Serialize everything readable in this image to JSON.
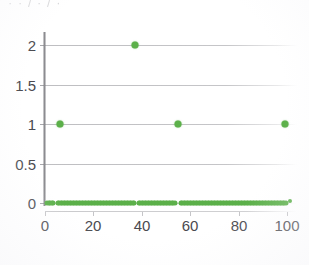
{
  "figure": {
    "title_remnant": "· · / · / ·",
    "background_color": "#ffffff",
    "marker_color": "#5cb04a",
    "gridline_color": "#96969b",
    "axis_color": "#78787d",
    "tick_label_color": "#4a4a4f"
  },
  "axes": {
    "y_ticks": [
      "0",
      "0.5",
      "1",
      "1.5",
      "2"
    ],
    "x_ticks": [
      "0",
      "20",
      "40",
      "60",
      "80",
      "100"
    ]
  },
  "chart_data": {
    "type": "scatter",
    "title": "",
    "xlabel": "",
    "ylabel": "",
    "xlim": [
      0,
      103
    ],
    "ylim": [
      0,
      2.18
    ],
    "grid": true,
    "legend": "none",
    "y_ticks": [
      0,
      0.5,
      1,
      1.5,
      2
    ],
    "x_ticks": [
      0,
      20,
      40,
      60,
      80,
      100
    ],
    "marker_color": "#5cb04a",
    "series": [
      {
        "name": "values",
        "description": "Dense run of points at y=0 across the full x range with three gaps, three isolated points at y=1, one isolated point at y=2, and a trailing point at y=100.",
        "points_y2": [
          [
            37,
            2
          ]
        ],
        "points_y1": [
          [
            6,
            1
          ],
          [
            55,
            1
          ],
          [
            99,
            1
          ]
        ],
        "points_y0_gaps": [
          [
            3.5,
            5.2
          ],
          [
            37.0,
            38.8
          ],
          [
            54.0,
            55.6
          ]
        ],
        "points_y0_range": [
          1,
          100
        ],
        "points_y0_step": 0.62
      }
    ]
  }
}
